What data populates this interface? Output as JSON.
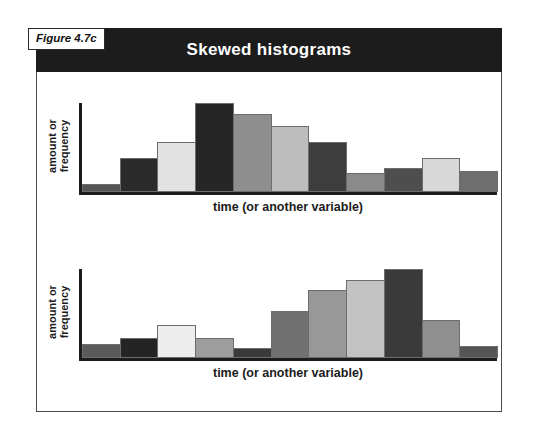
{
  "figure": {
    "tag": "Figure 4.7c",
    "title": "Skewed histograms",
    "title_bar_color": "#1c1c1c",
    "frame_color": "#4a4a4a",
    "background": "#ffffff"
  },
  "chart_data": [
    {
      "id": "top-histogram",
      "type": "bar",
      "title": "Skewed histograms",
      "subtitle": "right-skewed (positively skewed) distribution",
      "xlabel": "time (or another variable)",
      "ylabel": "amount or frequency",
      "ylabel_lines": [
        "amount or",
        "frequency"
      ],
      "grid": false,
      "legend": "none",
      "ylim": [
        0,
        100
      ],
      "categories": [
        "1",
        "2",
        "3",
        "4",
        "5",
        "6",
        "7",
        "8",
        "9",
        "10",
        "11"
      ],
      "values": [
        9,
        38,
        56,
        100,
        88,
        74,
        56,
        21,
        27,
        38,
        24
      ],
      "bar_colors": [
        "#555555",
        "#2b2b2b",
        "#e2e2e2",
        "#262626",
        "#8e8e8e",
        "#bdbdbd",
        "#3d3d3d",
        "#8a8a8a",
        "#4e4e4e",
        "#d8d8d8",
        "#6e6e6e"
      ],
      "bar_outline": "#6d6d6d"
    },
    {
      "id": "bottom-histogram",
      "type": "bar",
      "title": "Skewed histograms",
      "subtitle": "left-skewed (negatively skewed) distribution",
      "xlabel": "time (or another variable)",
      "ylabel": "amount or frequency",
      "ylabel_lines": [
        "amount or",
        "frequency"
      ],
      "grid": false,
      "legend": "none",
      "ylim": [
        0,
        100
      ],
      "categories": [
        "1",
        "2",
        "3",
        "4",
        "5",
        "6",
        "7",
        "8",
        "9",
        "10",
        "11"
      ],
      "values": [
        16,
        22,
        37,
        22,
        11,
        53,
        76,
        88,
        100,
        43,
        13
      ],
      "bar_colors": [
        "#5a5a5a",
        "#242424",
        "#ededed",
        "#9d9d9d",
        "#3a3a3a",
        "#717171",
        "#989898",
        "#c2c2c2",
        "#3a3a3a",
        "#8f8f8f",
        "#555555"
      ],
      "bar_outline": "#6d6d6d"
    }
  ]
}
